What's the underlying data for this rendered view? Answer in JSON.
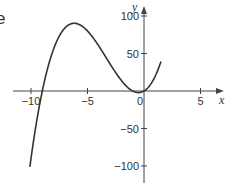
{
  "figure": {
    "partial_label": "e"
  },
  "chart_data": {
    "type": "line",
    "title": "",
    "xlabel": "x",
    "ylabel": "y",
    "function": "y = x^3 + 10x^2 + 9x",
    "xlim": [
      -11.5,
      7
    ],
    "ylim": [
      -110,
      105
    ],
    "x_ticks": [
      -10,
      -5,
      0,
      5
    ],
    "x_tick_labels": [
      "−10",
      "−5",
      "0",
      "5"
    ],
    "y_ticks": [
      100,
      50,
      -50,
      -100
    ],
    "y_tick_labels": [
      "100",
      "50",
      "−50",
      "−100"
    ],
    "grid": false,
    "legend": null,
    "series": [
      {
        "name": "curve",
        "x": [
          -10.1,
          -10,
          -9.5,
          -9,
          -8.5,
          -8,
          -7,
          -6,
          -5,
          -4,
          -3,
          -2,
          -1,
          -0.5,
          0,
          0.5,
          1,
          1.5
        ],
        "y": [
          -100.6,
          -90,
          -42.8,
          0,
          33.2,
          56,
          84,
          90,
          80,
          60,
          36,
          14,
          0,
          -2.1,
          0,
          7.1,
          20,
          39.4
        ]
      }
    ],
    "color": "#333333"
  }
}
